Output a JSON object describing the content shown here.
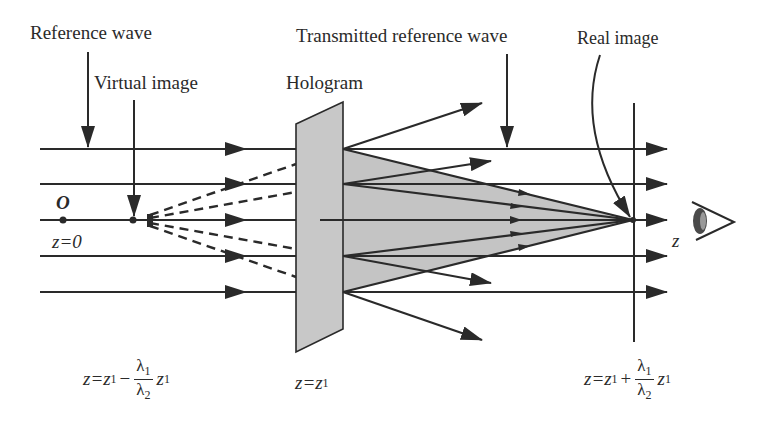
{
  "labels": {
    "reference_wave": "Reference wave",
    "virtual_image": "Virtual image",
    "hologram": "Hologram",
    "transmitted_reference_wave": "Transmitted reference wave",
    "real_image": "Real image",
    "origin": "O",
    "z_zero": "z=0",
    "z_axis": "z"
  },
  "formulas": {
    "virtual_position": {
      "lhs": "z=z",
      "lhs_sub": "1",
      "op": "−",
      "num": "λ",
      "num_sub": "1",
      "den": "λ",
      "den_sub": "2",
      "tail": "z",
      "tail_sub": "1"
    },
    "hologram_position": {
      "lhs": "z=z",
      "lhs_sub": "1"
    },
    "real_position": {
      "lhs": "z=z",
      "lhs_sub": "1",
      "op": "+",
      "num": "λ",
      "num_sub": "1",
      "den": "λ",
      "den_sub": "2",
      "tail": "z",
      "tail_sub": "1"
    }
  },
  "colors": {
    "line": "#2a2a2a",
    "hologram_fill": "#c8c8c8",
    "cone_fill": "#c4c4c4",
    "background": "#ffffff"
  },
  "geometry": {
    "beam_y": [
      149,
      184,
      220,
      256,
      292
    ],
    "hologram_x": 296,
    "real_image_x": 633,
    "virtual_image_x": 133,
    "origin_x": 63
  }
}
